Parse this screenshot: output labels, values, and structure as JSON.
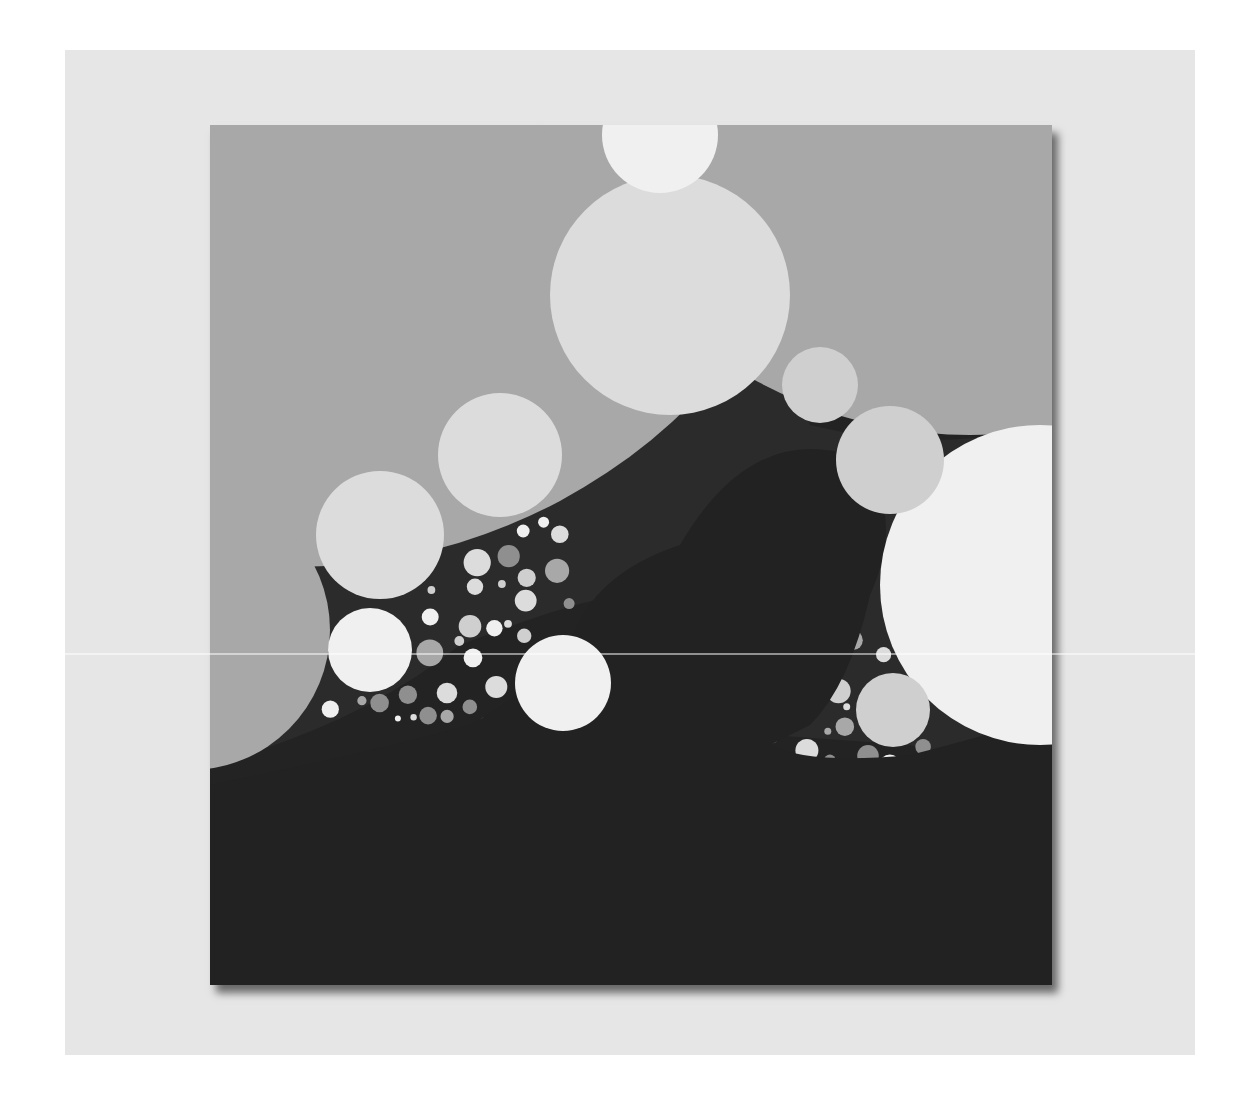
{
  "artwork": {
    "description": "circle packing artwork mounted on gray mat",
    "palette": {
      "page": "#ffffff",
      "mat": "#e6e6e6",
      "background_dark": "#222222",
      "gap_dark": "#2a2a2a",
      "gray_mid": "#a8a8a8",
      "gray_light": "#cfcfcf",
      "gray_pale": "#dcdcdc",
      "white": "#f0f0f0",
      "gray_dark_circle": "#8f8f8f"
    },
    "large_shapes": [
      {
        "cx": 86,
        "cy": -118,
        "r": 560,
        "fill": "gray_mid"
      },
      {
        "cx": 760,
        "cy": -140,
        "r": 450,
        "fill": "gray_mid"
      },
      {
        "cx": -20,
        "cy": 505,
        "r": 140,
        "fill": "gray_mid"
      },
      {
        "cx": 460,
        "cy": 170,
        "r": 120,
        "fill": "gray_pale"
      },
      {
        "cx": 450,
        "cy": 10,
        "r": 58,
        "fill": "white"
      },
      {
        "cx": 830,
        "cy": 460,
        "r": 160,
        "fill": "white"
      },
      {
        "cx": 290,
        "cy": 330,
        "r": 62,
        "fill": "gray_pale"
      },
      {
        "cx": 170,
        "cy": 410,
        "r": 64,
        "fill": "gray_pale"
      },
      {
        "cx": 160,
        "cy": 525,
        "r": 42,
        "fill": "white"
      },
      {
        "cx": 680,
        "cy": 335,
        "r": 54,
        "fill": "gray_light"
      },
      {
        "cx": 610,
        "cy": 260,
        "r": 38,
        "fill": "gray_light"
      },
      {
        "cx": 353,
        "cy": 558,
        "r": 48,
        "fill": "white"
      },
      {
        "cx": 683,
        "cy": 585,
        "r": 37,
        "fill": "gray_light"
      }
    ]
  }
}
